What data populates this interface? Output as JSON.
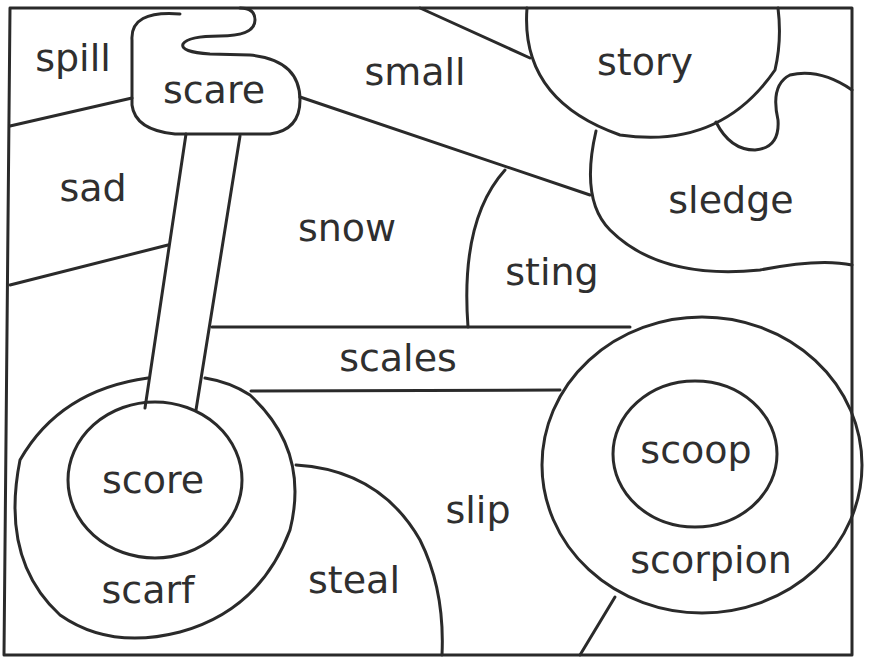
{
  "worksheet": {
    "type": "word-region coloring page",
    "line_color": "#2a2a2a",
    "background": "#ffffff",
    "words": [
      {
        "id": "spill",
        "label": "spill",
        "x": 73,
        "y": 58
      },
      {
        "id": "scare",
        "label": "scare",
        "x": 214,
        "y": 90
      },
      {
        "id": "small",
        "label": "small",
        "x": 415,
        "y": 72
      },
      {
        "id": "story",
        "label": "story",
        "x": 645,
        "y": 62
      },
      {
        "id": "sad",
        "label": "sad",
        "x": 93,
        "y": 188
      },
      {
        "id": "snow",
        "label": "snow",
        "x": 347,
        "y": 228
      },
      {
        "id": "sledge",
        "label": "sledge",
        "x": 731,
        "y": 200
      },
      {
        "id": "sting",
        "label": "sting",
        "x": 552,
        "y": 272
      },
      {
        "id": "scales",
        "label": "scales",
        "x": 398,
        "y": 358
      },
      {
        "id": "scoop",
        "label": "scoop",
        "x": 696,
        "y": 450
      },
      {
        "id": "score",
        "label": "score",
        "x": 153,
        "y": 480
      },
      {
        "id": "slip",
        "label": "slip",
        "x": 478,
        "y": 510
      },
      {
        "id": "scorpion",
        "label": "scorpion",
        "x": 711,
        "y": 560
      },
      {
        "id": "steal",
        "label": "steal",
        "x": 354,
        "y": 580
      },
      {
        "id": "scarf",
        "label": "scarf",
        "x": 148,
        "y": 590
      }
    ]
  }
}
